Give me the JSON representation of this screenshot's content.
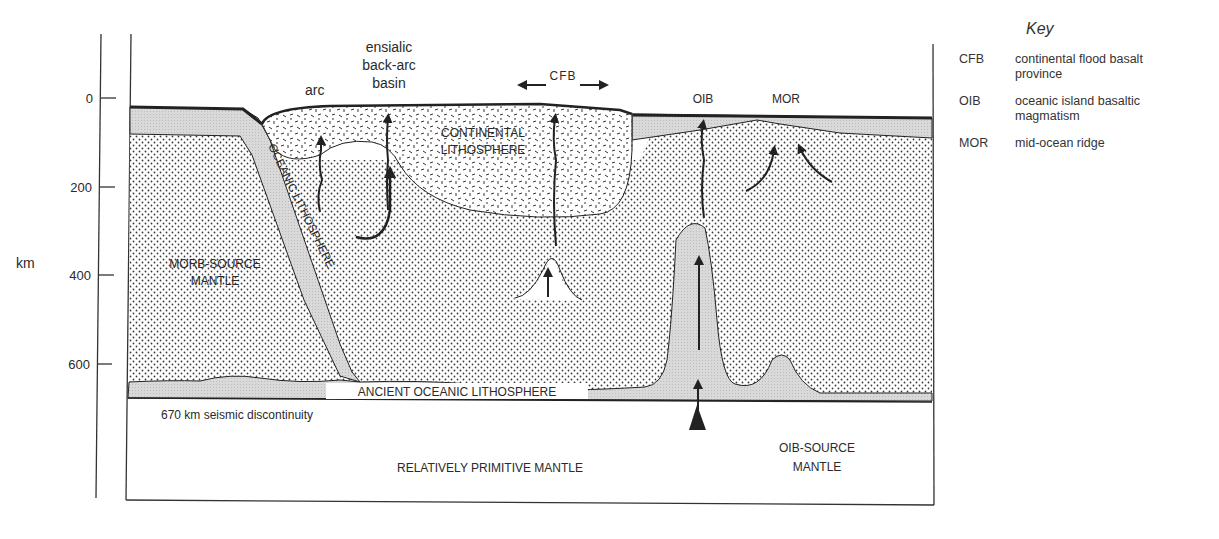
{
  "diagram": {
    "axis": {
      "unit_label": "km",
      "ticks": [
        {
          "label": "0",
          "y": 98
        },
        {
          "label": "200",
          "y": 187
        },
        {
          "label": "400",
          "y": 275
        },
        {
          "label": "600",
          "y": 364
        }
      ]
    },
    "surface_labels": {
      "arc": "arc",
      "back_arc_line1": "ensialic",
      "back_arc_line2": "back-arc",
      "back_arc_line3": "basin",
      "cfb": "CFB",
      "oib": "OIB",
      "mor": "MOR"
    },
    "region_labels": {
      "continental_line1": "CONTINENTAL",
      "continental_line2": "LITHOSPHERE",
      "oceanic_slab": "OCEANIC LITHOSPHERE",
      "morb_line1": "MORB-SOURCE",
      "morb_line2": "MANTLE",
      "ancient": "ANCIENT OCEANIC LITHOSPHERE",
      "discontinuity": "670 km seismic discontinuity",
      "primitive": "RELATIVELY PRIMITIVE MANTLE",
      "oib_source_line1": "OIB-SOURCE",
      "oib_source_line2": "MANTLE"
    },
    "colors": {
      "lithosphere_gray": "#d6d6d6",
      "line": "#222222",
      "dot": "#3a3a3a"
    }
  },
  "key": {
    "title": "Key",
    "items": [
      {
        "abbr": "CFB",
        "desc_line1": "continental flood basalt",
        "desc_line2": "province"
      },
      {
        "abbr": "OIB",
        "desc_line1": "oceanic island basaltic",
        "desc_line2": "magmatism"
      },
      {
        "abbr": "MOR",
        "desc_line1": "mid-ocean ridge",
        "desc_line2": ""
      }
    ]
  }
}
